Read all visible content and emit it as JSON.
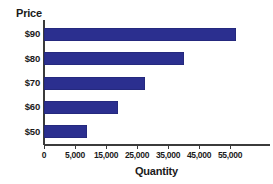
{
  "chart_data": {
    "type": "bar",
    "orientation": "horizontal",
    "title": "",
    "xlabel": "Quantity",
    "ylabel": "Price",
    "categories": [
      "$90",
      "$80",
      "$70",
      "$60",
      "$50"
    ],
    "values": [
      57000,
      40000,
      27500,
      19000,
      9000
    ],
    "series": [
      {
        "name": "Quantity",
        "values": [
          57000,
          40000,
          27500,
          19000,
          9000
        ],
        "color": "#2b2f8f"
      }
    ],
    "xlim": [
      0,
      60000
    ],
    "ylim": null,
    "x_tick_labels": [
      "0",
      "5,000",
      "15,000",
      "25,000",
      "35,000",
      "45,000",
      "55,000"
    ],
    "x_tick_values": [
      0,
      5000,
      15000,
      25000,
      35000,
      45000,
      55000
    ],
    "y_tick_labels": [
      "$90",
      "$80",
      "$70",
      "$60",
      "$50"
    ],
    "grid": false,
    "legend": null,
    "bar_color": "#2b2f8f",
    "axis_color": "#3b3b3b",
    "text_color": "#1a1a1a",
    "background": "#ffffff"
  }
}
